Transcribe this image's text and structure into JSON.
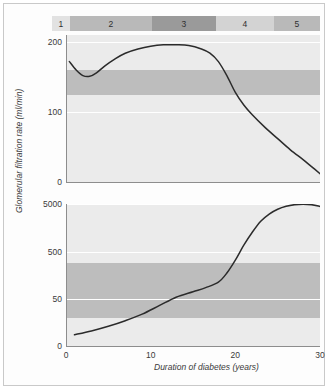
{
  "figure": {
    "stage_bar": {
      "name": "nephropathy-stages",
      "segments": [
        {
          "label": "1",
          "x": 0,
          "w": 18,
          "color": "#e2e2e2"
        },
        {
          "label": "2",
          "x": 18,
          "w": 82,
          "color": "#b9b9b9"
        },
        {
          "label": "3",
          "x": 100,
          "w": 64,
          "color": "#9a9a9a"
        },
        {
          "label": "4",
          "x": 164,
          "w": 58,
          "color": "#d3d3d3"
        },
        {
          "label": "5",
          "x": 222,
          "w": 46,
          "color": "#b9b9b9"
        }
      ]
    }
  },
  "chart_data": [
    {
      "type": "line",
      "id": "gfr",
      "title": "",
      "ylabel": "Glomerular filtration rate (ml/min)",
      "xlabel": "",
      "ylim": [
        0,
        210
      ],
      "xlim": [
        0,
        30
      ],
      "yticks": [
        0,
        100,
        200
      ],
      "ytick_labels": [
        "0",
        "100",
        "200"
      ],
      "xticks": [
        0,
        10,
        20,
        30
      ],
      "grid": true,
      "bands": [
        {
          "from": 125,
          "to": 160,
          "color": "#bdbdbd"
        }
      ],
      "series": [
        {
          "name": "Glomerular filtration rate",
          "x": [
            0.4,
            1.2,
            2.0,
            2.8,
            3.6,
            4.6,
            5.8,
            7.0,
            8.5,
            10.0,
            11.5,
            13.0,
            14.5,
            16.0,
            17.0,
            18.0,
            19.0,
            20.0,
            21.0,
            22.0,
            23.5,
            25.0,
            26.5,
            28.0,
            29.0,
            30.0
          ],
          "y": [
            172,
            160,
            152,
            151,
            156,
            166,
            176,
            184,
            190,
            194,
            196,
            196,
            195,
            190,
            184,
            172,
            152,
            128,
            110,
            96,
            78,
            62,
            46,
            32,
            22,
            12
          ]
        }
      ]
    },
    {
      "type": "line",
      "id": "albumin",
      "title": "",
      "ylabel": "Urinary albumin excretion rate (µg/min)",
      "xlabel": "Duration of diabetes (years)",
      "yscale": "log-like",
      "ylim": [
        0,
        5000
      ],
      "xlim": [
        0,
        30
      ],
      "yticks": [
        0,
        50,
        500,
        5000
      ],
      "ytick_labels": [
        "0",
        "50",
        "500",
        "5000"
      ],
      "xticks": [
        0,
        10,
        20,
        30
      ],
      "xtick_labels": [
        "0",
        "10",
        "20",
        "30"
      ],
      "grid": true,
      "bands": [
        {
          "from": 30,
          "to": 300,
          "color": "#bdbdbd"
        }
      ],
      "series": [
        {
          "name": "Urinary albumin excretion rate",
          "x": [
            1.0,
            3.0,
            5.0,
            7.0,
            9.0,
            11.0,
            13.0,
            15.0,
            16.5,
            18.0,
            19.0,
            20.0,
            21.0,
            22.0,
            23.0,
            24.0,
            25.0,
            26.0,
            27.0,
            28.0,
            29.0,
            30.0
          ],
          "y": [
            12,
            16,
            21,
            27,
            34,
            43,
            55,
            72,
            88,
            115,
            180,
            340,
            700,
            1300,
            2200,
            3100,
            3900,
            4500,
            4850,
            4950,
            4850,
            4450
          ]
        }
      ]
    }
  ]
}
